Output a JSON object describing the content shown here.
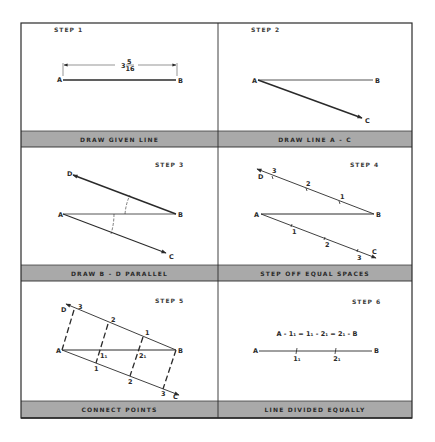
{
  "colors": {
    "frame": "#2a2a2a",
    "caption_band": "#a9a9a9",
    "background": "#ffffff",
    "ink": "#2a2a2a"
  },
  "panels": [
    {
      "step": "STEP 1",
      "caption": "DRAW GIVEN LINE",
      "points": {
        "a": "A",
        "b": "B"
      },
      "dimension": {
        "whole": "3",
        "numerator": "5",
        "denominator": "16"
      }
    },
    {
      "step": "STEP 2",
      "caption": "DRAW LINE A - C",
      "points": {
        "a": "A",
        "b": "B",
        "c": "C"
      }
    },
    {
      "step": "STEP 3",
      "caption": "DRAW B - D PARALLEL",
      "points": {
        "a": "A",
        "b": "B",
        "c": "C",
        "d": "D"
      }
    },
    {
      "step": "STEP 4",
      "caption": "STEP OFF EQUAL SPACES",
      "points": {
        "a": "A",
        "b": "B",
        "c": "C",
        "d": "D"
      },
      "marks_upper": [
        "3",
        "2",
        "1"
      ],
      "marks_lower": [
        "1",
        "2",
        "3"
      ]
    },
    {
      "step": "STEP 5",
      "caption": "CONNECT POINTS",
      "points": {
        "a": "A",
        "b": "B",
        "c": "C",
        "d": "D"
      },
      "marks_upper": [
        "3",
        "2",
        "1"
      ],
      "marks_lower": [
        "1",
        "2",
        "3"
      ],
      "intersections": [
        "1₁",
        "2₁"
      ]
    },
    {
      "step": "STEP 6",
      "caption": "LINE DIVIDED EQUALLY",
      "equation": "A - 1₁ = 1₁ - 2₁ = 2₁ - B",
      "points": {
        "a": "A",
        "b": "B"
      },
      "divisions": [
        "1₁",
        "2₁"
      ]
    }
  ]
}
